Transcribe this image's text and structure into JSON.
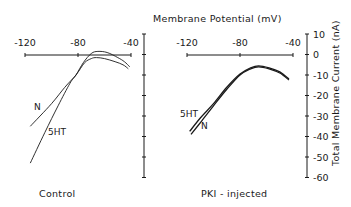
{
  "chart_data": {
    "type": "line",
    "title": "Membrane Potential (mV)",
    "xlabel": "Membrane Potential (mV)",
    "ylabel": "Total Membrane Current (nA)",
    "xlim": [
      -120,
      -40
    ],
    "ylim": [
      -60,
      10
    ],
    "x_ticks": [
      "-120",
      "-80",
      "-40"
    ],
    "y_ticks": [
      "10",
      "0",
      "-10",
      "-20",
      "-30",
      "-40",
      "-50",
      "-60"
    ],
    "y_tick_values": [
      10,
      0,
      -10,
      -20,
      -30,
      -40,
      -50,
      -60
    ],
    "x_tick_values": [
      -120,
      -80,
      -40
    ],
    "grid": false,
    "panels": [
      {
        "name": "Control",
        "series": [
          {
            "name": "N",
            "points": [
              [
                -116,
                -35
              ],
              [
                -100,
                -24
              ],
              [
                -90,
                -16
              ],
              [
                -81.5,
                -10
              ],
              [
                -75,
                -4
              ],
              [
                -70,
                -2
              ],
              [
                -66,
                -1.5
              ],
              [
                -60,
                -2
              ],
              [
                -52,
                -3.5
              ],
              [
                -46,
                -5
              ],
              [
                -42,
                -7
              ]
            ]
          },
          {
            "name": "5HT",
            "points": [
              [
                -116,
                -53
              ],
              [
                -105,
                -38
              ],
              [
                -95,
                -25
              ],
              [
                -86,
                -14
              ],
              [
                -81.5,
                -10
              ],
              [
                -76,
                -4
              ],
              [
                -70,
                0.5
              ],
              [
                -65,
                1.5
              ],
              [
                -58,
                1
              ],
              [
                -50,
                -1.5
              ],
              [
                -45,
                -3.5
              ],
              [
                -41,
                -6
              ]
            ]
          }
        ]
      },
      {
        "name": "PKI - injected",
        "series": [
          {
            "name": "5HT",
            "points": [
              [
                -118,
                -37.5
              ],
              [
                -110,
                -31
              ],
              [
                -100,
                -24
              ],
              [
                -90,
                -16
              ],
              [
                -80,
                -9.5
              ],
              [
                -72,
                -6.5
              ],
              [
                -66,
                -5.5
              ],
              [
                -58,
                -6.5
              ],
              [
                -50,
                -8.5
              ],
              [
                -43,
                -12
              ]
            ]
          },
          {
            "name": "N",
            "points": [
              [
                -117,
                -39
              ],
              [
                -109,
                -32.5
              ],
              [
                -100,
                -25
              ],
              [
                -90,
                -17
              ],
              [
                -80,
                -10
              ],
              [
                -72,
                -7
              ],
              [
                -66,
                -6
              ],
              [
                -58,
                -7
              ],
              [
                -50,
                -9
              ],
              [
                -43,
                -12.5
              ]
            ]
          }
        ]
      }
    ]
  },
  "labels": {
    "title": "Membrane Potential (mV)",
    "y_axis_label": "Total Membrane Current (nA)",
    "panel_left": "Control",
    "panel_right": "PKI - injected",
    "left_N": "N",
    "left_5HT": "5HT",
    "right_5HT": "5HT",
    "right_N": "N"
  }
}
